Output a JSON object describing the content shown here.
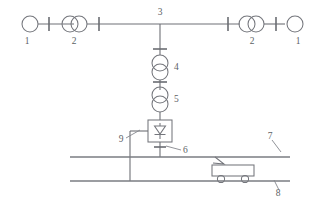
{
  "diagram": {
    "type": "electrical-single-line-diagram",
    "background_color": "#ffffff",
    "line_color": "#6e7076",
    "label_color": "#5d5f65",
    "labels": {
      "source_left": "1",
      "transformer_left": "2",
      "busbar_node": "3",
      "transformer_step1": "4",
      "transformer_step2": "5",
      "feeder_cable": "6",
      "catenary_contact_wire": "7",
      "running_rail": "8",
      "return_feeder": "9",
      "transformer_right": "2",
      "source_right": "1"
    },
    "components": [
      {
        "id": "1L",
        "label": "1",
        "name": "power-source-left",
        "kind": "generator-circle"
      },
      {
        "id": "CB1L",
        "label": "",
        "name": "circuit-breaker-left-outer",
        "kind": "breaker-tick"
      },
      {
        "id": "2L",
        "label": "2",
        "name": "transformer-left",
        "kind": "two-winding-transformer-horizontal"
      },
      {
        "id": "CB2L",
        "label": "",
        "name": "circuit-breaker-left-inner",
        "kind": "breaker-tick"
      },
      {
        "id": "3",
        "label": "3",
        "name": "busbar-node",
        "kind": "bus-tap"
      },
      {
        "id": "CB3",
        "label": "",
        "name": "circuit-breaker-feeder",
        "kind": "breaker-tick"
      },
      {
        "id": "4",
        "label": "4",
        "name": "transformer-step-down-1",
        "kind": "two-winding-transformer-vertical"
      },
      {
        "id": "CB4",
        "label": "",
        "name": "circuit-breaker-mid",
        "kind": "breaker-tick"
      },
      {
        "id": "5",
        "label": "5",
        "name": "transformer-step-down-2",
        "kind": "two-winding-transformer-vertical"
      },
      {
        "id": "RECT",
        "label": "",
        "name": "rectifier-unit",
        "kind": "rectifier-box-diode"
      },
      {
        "id": "6",
        "label": "6",
        "name": "feeder-cable",
        "kind": "cable-tick"
      },
      {
        "id": "9",
        "label": "9",
        "name": "return-feeder",
        "kind": "return-conductor"
      },
      {
        "id": "7",
        "label": "7",
        "name": "catenary-contact-wire",
        "kind": "rail-line"
      },
      {
        "id": "8",
        "label": "8",
        "name": "running-rail",
        "kind": "rail-line"
      },
      {
        "id": "TRAIN",
        "label": "",
        "name": "electric-vehicle",
        "kind": "train-car-with-pantograph"
      },
      {
        "id": "CB2R",
        "label": "",
        "name": "circuit-breaker-right-inner",
        "kind": "breaker-tick"
      },
      {
        "id": "2R",
        "label": "2",
        "name": "transformer-right",
        "kind": "two-winding-transformer-horizontal"
      },
      {
        "id": "CB1R",
        "label": "",
        "name": "circuit-breaker-right-outer",
        "kind": "breaker-tick"
      },
      {
        "id": "1R",
        "label": "1",
        "name": "power-source-right",
        "kind": "generator-circle"
      }
    ]
  }
}
